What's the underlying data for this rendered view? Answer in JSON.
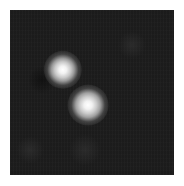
{
  "image": {
    "description": "Grayscale fluorescence-style image with two bright point sources on a dark background",
    "background_color": "#1c1c1c",
    "border_color": "#ffffff"
  },
  "spots": [
    {
      "label": "spot-upper-left",
      "x": 63,
      "y": 70,
      "radius": 16,
      "core_color": "#ffffff",
      "halo_color": "#9a9a9a"
    },
    {
      "label": "spot-lower-right",
      "x": 88,
      "y": 105,
      "radius": 17,
      "core_color": "#ffffff",
      "halo_color": "#a0a0a0"
    }
  ],
  "faint_features": [
    {
      "x": 132,
      "y": 45,
      "radius": 14
    },
    {
      "x": 30,
      "y": 150,
      "radius": 14
    },
    {
      "x": 85,
      "y": 150,
      "radius": 16
    }
  ],
  "dark_region": {
    "x": 42,
    "y": 80,
    "radius": 14
  }
}
